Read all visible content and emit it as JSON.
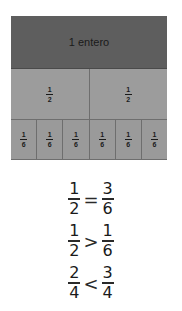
{
  "diagram": {
    "whole_label": "1 entero",
    "halves": [
      {
        "num": "1",
        "den": "2"
      },
      {
        "num": "1",
        "den": "2"
      }
    ],
    "sixths": [
      {
        "num": "1",
        "den": "6"
      },
      {
        "num": "1",
        "den": "6"
      },
      {
        "num": "1",
        "den": "6"
      },
      {
        "num": "1",
        "den": "6"
      },
      {
        "num": "1",
        "den": "6"
      },
      {
        "num": "1",
        "den": "6"
      }
    ],
    "colors": {
      "whole": "#5e5e5e",
      "parts": "#9a9a9a",
      "border": "#6e6e6e"
    }
  },
  "comparisons": [
    {
      "left": {
        "num": "1",
        "den": "2"
      },
      "op": "=",
      "right": {
        "num": "3",
        "den": "6"
      }
    },
    {
      "left": {
        "num": "1",
        "den": "2"
      },
      "op": ">",
      "right": {
        "num": "1",
        "den": "6"
      }
    },
    {
      "left": {
        "num": "2",
        "den": "4"
      },
      "op": "<",
      "right": {
        "num": "3",
        "den": "4"
      }
    }
  ]
}
